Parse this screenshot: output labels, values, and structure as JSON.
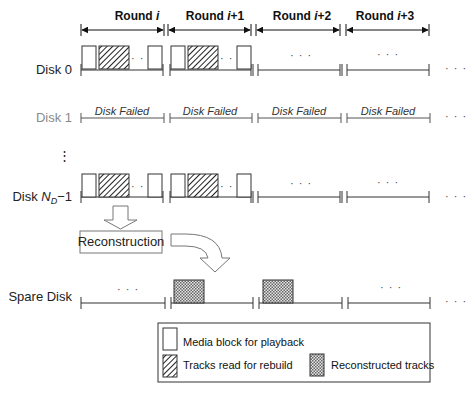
{
  "rounds": [
    {
      "label": "Round ",
      "var": "i",
      "suffix": ""
    },
    {
      "label": "Round ",
      "var": "i",
      "suffix": "+1"
    },
    {
      "label": "Round ",
      "var": "i",
      "suffix": "+2"
    },
    {
      "label": "Round ",
      "var": "i",
      "suffix": "+3"
    }
  ],
  "disks": {
    "disk0": "Disk 0",
    "disk1": "Disk 1",
    "diskN_prefix": "Disk ",
    "diskN_var": "N",
    "diskN_sub": "D",
    "diskN_suffix": "−1",
    "spare": "Spare Disk"
  },
  "disk_failed_label": "Disk Failed",
  "ellipsis": "· · ·",
  "vertical_ellipsis": "⋮",
  "reconstruction_label": "Reconstruction",
  "legend": {
    "media_block": "Media block for playback",
    "tracks_read": "Tracks read for rebuild",
    "reconstructed": "Reconstructed tracks"
  },
  "colors": {
    "line": "#333333",
    "failed_text": "#8a8a8a",
    "background": "#ffffff"
  }
}
